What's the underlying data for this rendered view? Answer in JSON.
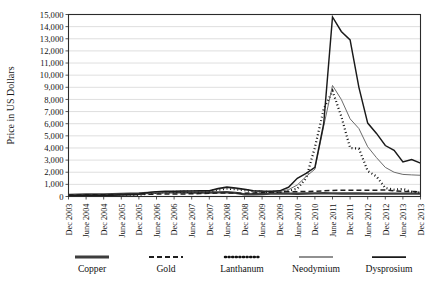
{
  "chart_data": {
    "type": "line",
    "title": "",
    "xlabel": "",
    "ylabel": "Price in US Dollars",
    "ylim": [
      0,
      15000
    ],
    "ytick_step": 1000,
    "grid": true,
    "legend_position": "bottom",
    "yticks": [
      "0",
      "1,000",
      "2,000",
      "3,000",
      "4,000",
      "5,000",
      "6,000",
      "7,000",
      "8,000",
      "9,000",
      "10,000",
      "11,000",
      "12,000",
      "13,000",
      "14,000",
      "15,000"
    ],
    "categories": [
      "Dec 2003",
      "June 2004",
      "Dec 2004",
      "June 2005",
      "Dec 2005",
      "June 2006",
      "Dec 2006",
      "June 2007",
      "Dec 2007",
      "June 2008",
      "Dec 2008",
      "June 2009",
      "Dec 2009",
      "June 2010",
      "Dec 2010",
      "June 2011",
      "Dec 2011",
      "June 2012",
      "Dec 2012",
      "June 2013",
      "Dec 2013"
    ],
    "series": [
      {
        "name": "Copper",
        "style": "thick-solid",
        "color": "#3d3d3d",
        "width": 2.4,
        "dash": "none",
        "values": [
          120,
          150,
          160,
          180,
          230,
          300,
          350,
          340,
          330,
          350,
          170,
          200,
          240,
          230,
          250,
          260,
          250,
          240,
          240,
          240,
          240
        ]
      },
      {
        "name": "Gold",
        "style": "dashed",
        "color": "#1f1f1f",
        "width": 1.5,
        "dash": "5,3",
        "values": [
          130,
          135,
          140,
          145,
          160,
          190,
          200,
          215,
          260,
          290,
          270,
          300,
          350,
          390,
          420,
          470,
          520,
          500,
          530,
          430,
          400
        ]
      },
      {
        "name": "Lanthanum",
        "style": "dotted",
        "color": "#111111",
        "width": 2.2,
        "dash": "1,2.6",
        "values": [
          40,
          45,
          50,
          60,
          120,
          330,
          380,
          400,
          420,
          620,
          530,
          410,
          380,
          600,
          4000,
          8700,
          5000,
          1700,
          620,
          400,
          330
        ]
      },
      {
        "name": "Neodymium",
        "style": "thin-solid",
        "color": "#6b6b6b",
        "width": 1.0,
        "dash": "none",
        "values": [
          50,
          55,
          60,
          70,
          150,
          350,
          400,
          420,
          450,
          700,
          560,
          430,
          400,
          900,
          2200,
          9200,
          6400,
          4000,
          2400,
          1850,
          1750
        ]
      },
      {
        "name": "Dysprosium",
        "style": "solid",
        "color": "#1a1a1a",
        "width": 1.45,
        "dash": "none",
        "values": [
          70,
          75,
          80,
          90,
          180,
          400,
          440,
          460,
          480,
          760,
          600,
          470,
          440,
          1500,
          2400,
          14800,
          12900,
          6000,
          4200,
          2900,
          2750
        ]
      }
    ],
    "detail_points": {
      "x_months": [
        "2003-12",
        "2004-03",
        "2004-06",
        "2004-09",
        "2004-12",
        "2005-03",
        "2005-06",
        "2005-09",
        "2005-12",
        "2006-03",
        "2006-06",
        "2006-09",
        "2006-12",
        "2007-03",
        "2007-06",
        "2007-09",
        "2007-12",
        "2008-03",
        "2008-06",
        "2008-09",
        "2008-12",
        "2009-03",
        "2009-06",
        "2009-09",
        "2009-12",
        "2010-03",
        "2010-06",
        "2010-09",
        "2010-12",
        "2011-03",
        "2011-06",
        "2011-09",
        "2011-12",
        "2012-03",
        "2012-06",
        "2012-09",
        "2012-12",
        "2013-03",
        "2013-06",
        "2013-09",
        "2013-12"
      ],
      "Copper": [
        130,
        150,
        160,
        165,
        175,
        180,
        200,
        230,
        250,
        300,
        330,
        345,
        350,
        345,
        335,
        330,
        330,
        340,
        355,
        300,
        175,
        190,
        210,
        235,
        245,
        240,
        230,
        250,
        260,
        265,
        255,
        250,
        245,
        245,
        240,
        240,
        240,
        240,
        240,
        240,
        240
      ],
      "Gold": [
        130,
        132,
        136,
        140,
        145,
        150,
        155,
        165,
        175,
        190,
        196,
        200,
        205,
        212,
        220,
        240,
        265,
        285,
        295,
        285,
        270,
        295,
        320,
        350,
        375,
        390,
        400,
        415,
        430,
        465,
        500,
        520,
        525,
        510,
        505,
        520,
        535,
        470,
        420,
        405,
        400
      ],
      "Lanthanum": [
        40,
        42,
        45,
        48,
        52,
        58,
        70,
        95,
        125,
        250,
        330,
        360,
        380,
        400,
        415,
        420,
        430,
        560,
        640,
        590,
        520,
        430,
        395,
        380,
        390,
        460,
        640,
        1500,
        4050,
        7200,
        8700,
        6600,
        4000,
        3950,
        2100,
        1650,
        700,
        560,
        620,
        400,
        330
      ],
      "Neodymium": [
        50,
        52,
        56,
        60,
        70,
        85,
        105,
        130,
        155,
        280,
        350,
        380,
        400,
        420,
        430,
        440,
        455,
        610,
        720,
        640,
        560,
        440,
        410,
        400,
        420,
        560,
        950,
        1650,
        2250,
        5800,
        9150,
        8000,
        6400,
        5600,
        4100,
        3200,
        2400,
        2000,
        1820,
        1780,
        1750
      ],
      "Dysprosium": [
        70,
        72,
        76,
        82,
        92,
        110,
        135,
        160,
        185,
        320,
        400,
        425,
        440,
        455,
        465,
        470,
        480,
        660,
        780,
        700,
        600,
        480,
        450,
        440,
        470,
        760,
        1500,
        1900,
        2400,
        6000,
        14800,
        13600,
        12900,
        9000,
        6050,
        5200,
        4200,
        3800,
        2850,
        3050,
        2750
      ]
    }
  },
  "legend": {
    "items": [
      {
        "label": "Copper",
        "key": "copper"
      },
      {
        "label": "Gold",
        "key": "gold"
      },
      {
        "label": "Lanthanum",
        "key": "lanthanum"
      },
      {
        "label": "Neodymium",
        "key": "neodymium"
      },
      {
        "label": "Dysprosium",
        "key": "dysprosium"
      }
    ]
  }
}
